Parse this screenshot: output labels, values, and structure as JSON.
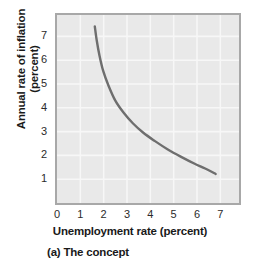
{
  "figure": {
    "caption": "(a) The concept"
  },
  "chart_data": {
    "type": "line",
    "title": "",
    "subtitle": "",
    "xlabel": "Unemployment rate (percent)",
    "ylabel_line1": "Annual rate of inflation",
    "ylabel_line2": "(percent)",
    "ylabel": "Annual rate of inflation (percent)",
    "xlim": [
      0,
      7.8
    ],
    "ylim": [
      0,
      7.9
    ],
    "xticks": [
      "0",
      "1",
      "2",
      "3",
      "4",
      "5",
      "6",
      "7"
    ],
    "xtick_values": [
      0,
      1,
      2,
      3,
      4,
      5,
      6,
      7
    ],
    "yticks": [
      "1",
      "2",
      "3",
      "4",
      "5",
      "6",
      "7"
    ],
    "ytick_values": [
      1,
      2,
      3,
      4,
      5,
      6,
      7
    ],
    "grid": true,
    "grid_color": "#f7f7f7",
    "plot_background": "#e9e9e9",
    "legend": "none",
    "series": [
      {
        "name": "Phillips curve",
        "color": "#6e6e6e",
        "x": [
          1.62,
          1.7,
          1.82,
          1.98,
          2.2,
          2.5,
          2.85,
          3.25,
          3.7,
          4.2,
          4.75,
          5.3,
          5.9,
          6.35,
          6.8
        ],
        "y": [
          7.42,
          6.85,
          6.2,
          5.55,
          4.95,
          4.3,
          3.8,
          3.35,
          2.95,
          2.6,
          2.25,
          1.95,
          1.65,
          1.45,
          1.22
        ]
      }
    ],
    "annotations": []
  }
}
